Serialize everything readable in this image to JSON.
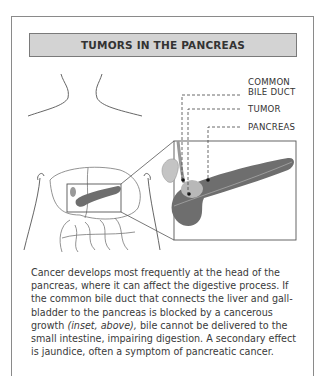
{
  "title": "TUMORS IN THE PANCREAS",
  "labels": {
    "bile_duct_line1": "COMMON",
    "bile_duct_line2": "BILE DUCT",
    "tumor": "TUMOR",
    "pancreas": "PANCREAS"
  },
  "caption": {
    "part1": "Cancer develops most frequently at the head of the pancreas, where it can affect the digestive process. If the common bile duct that connects the liver and gall-bladder to the pancreas is blocked by a cancerous growth ",
    "italic": "(inset, above),",
    "part2": " bile cannot be delivered to the small intestine, impairing digestion. A secondary effect is jaundice, often a symptom of pancreatic cancer."
  },
  "colors": {
    "title_bg": "#d3d3d3",
    "pancreas": "#6e6e6e",
    "tumor": "#b8b8b8",
    "gallbladder": "#c4c4c4"
  }
}
